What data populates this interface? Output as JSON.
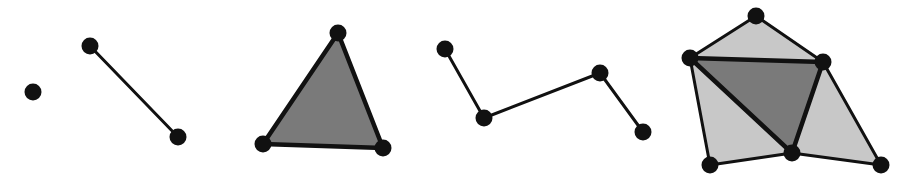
{
  "diagram": {
    "title": "Simplices and simplicial complexes",
    "colors": {
      "background": "#ffffff",
      "vertex": "#111111",
      "edge": "#111111",
      "face_dark": "#7a7a7a",
      "face_light": "#c8c8c8"
    },
    "panels": [
      {
        "id": "0-simplex",
        "label": "0-simplex (point)",
        "vertices": [
          [
            33,
            92
          ]
        ],
        "edges": [],
        "faces": []
      },
      {
        "id": "1-simplex",
        "label": "1-simplex (edge)",
        "vertices": [
          [
            90,
            46
          ],
          [
            178,
            137
          ]
        ],
        "edges": [
          [
            0,
            1
          ]
        ],
        "faces": []
      },
      {
        "id": "2-simplex",
        "label": "2-simplex (triangle)",
        "vertices": [
          [
            338,
            33
          ],
          [
            263,
            144
          ],
          [
            383,
            148
          ]
        ],
        "edges": [
          [
            0,
            1
          ],
          [
            1,
            2
          ],
          [
            2,
            0
          ]
        ],
        "faces": [
          {
            "v": [
              0,
              1,
              2
            ],
            "shade": "dark"
          }
        ]
      },
      {
        "id": "1-complex",
        "label": "1-dimensional simplicial complex (path)",
        "vertices": [
          [
            445,
            49
          ],
          [
            484,
            118
          ],
          [
            600,
            73
          ],
          [
            643,
            132
          ]
        ],
        "edges": [
          [
            0,
            1
          ],
          [
            1,
            2
          ],
          [
            2,
            3
          ]
        ],
        "faces": []
      },
      {
        "id": "2-complex",
        "label": "2-dimensional simplicial complex",
        "vertices": [
          [
            756,
            16
          ],
          [
            690,
            58
          ],
          [
            823,
            62
          ],
          [
            792,
            153
          ],
          [
            710,
            165
          ],
          [
            881,
            165
          ]
        ],
        "edges": [
          [
            0,
            1
          ],
          [
            0,
            2
          ],
          [
            1,
            2
          ],
          [
            1,
            3
          ],
          [
            2,
            3
          ],
          [
            1,
            4
          ],
          [
            4,
            3
          ],
          [
            2,
            5
          ],
          [
            3,
            5
          ]
        ],
        "faces": [
          {
            "v": [
              0,
              1,
              2
            ],
            "shade": "light"
          },
          {
            "v": [
              1,
              4,
              3
            ],
            "shade": "light"
          },
          {
            "v": [
              2,
              3,
              5
            ],
            "shade": "light"
          },
          {
            "v": [
              1,
              2,
              3
            ],
            "shade": "dark"
          }
        ]
      }
    ]
  }
}
